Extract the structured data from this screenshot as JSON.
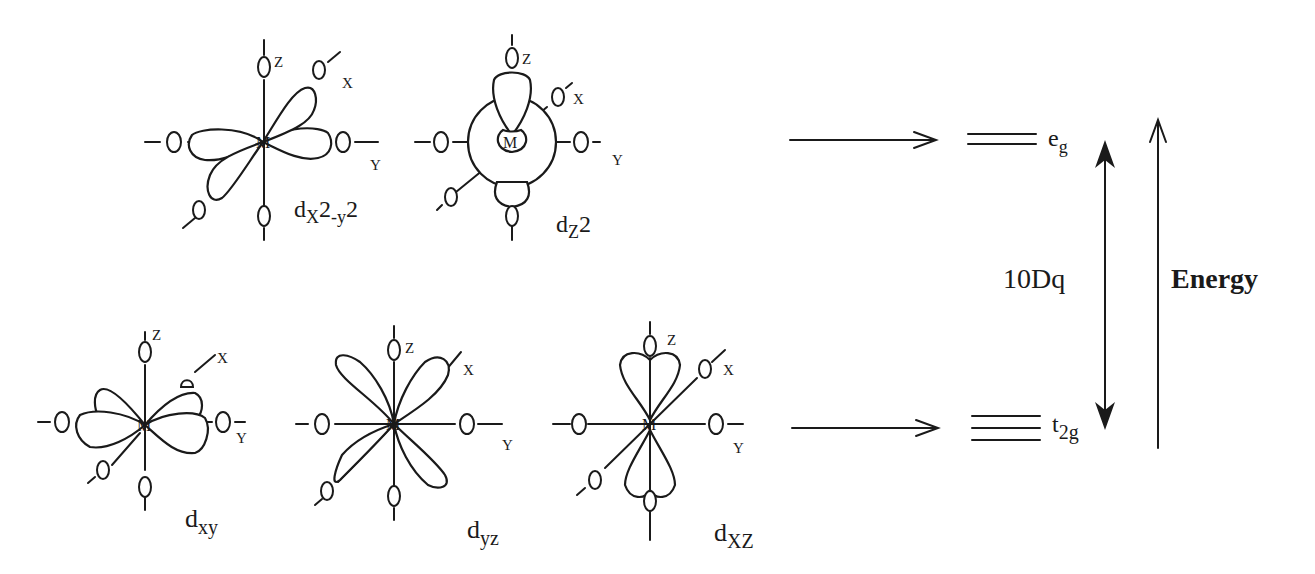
{
  "diagram": {
    "type": "crystal-field-splitting",
    "center_atom": "M",
    "ligand_atom": "O",
    "axes": {
      "x": "X",
      "y": "Y",
      "z": "Z"
    },
    "orbitals_top": [
      {
        "id": "dx2-y2",
        "label_main": "d",
        "label_sub": "X",
        "label_rest": "2",
        "label_sub2": "-y",
        "label_rest2": "2"
      },
      {
        "id": "dz2",
        "label_main": "d",
        "label_sub": "Z",
        "label_rest": "2"
      }
    ],
    "orbitals_bottom": [
      {
        "id": "dxy",
        "label_main": "d",
        "label_sub": "xy"
      },
      {
        "id": "dyz",
        "label_main": "d",
        "label_sub": "yz"
      },
      {
        "id": "dxz",
        "label_main": "d",
        "label_sub": "XZ"
      }
    ],
    "levels": {
      "upper": {
        "label_main": "e",
        "label_sub": "g",
        "lines": 2
      },
      "lower": {
        "label_main": "t",
        "label_sub_pre": "2g",
        "lines": 3
      }
    },
    "splitting_label": "10Dq",
    "energy_label": "Energy"
  }
}
